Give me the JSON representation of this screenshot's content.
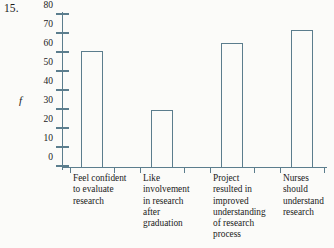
{
  "problem": {
    "number": "15."
  },
  "chart_data": {
    "type": "bar",
    "title": "",
    "subtitle": "",
    "xlabel": "",
    "ylabel": "f",
    "ylim": [
      0,
      80
    ],
    "yticks": [
      0,
      10,
      20,
      30,
      40,
      50,
      60,
      70,
      80
    ],
    "ytick_labels": [
      "0",
      "10",
      "20",
      "30",
      "40",
      "50",
      "60",
      "70",
      "80"
    ],
    "grid": false,
    "legend": null,
    "legend_position": "none",
    "bar_style": "outlined",
    "colors": {
      "bar_outline": "#5b7d8d",
      "bar_fill": "none",
      "axis": "#5b7d8d",
      "text": "#1a1a1a",
      "background": "#fbfbf9"
    },
    "categories": [
      "Feel confident to evaluate research",
      "Like involvement in research after graduation",
      "Project resulted in improved understanding of research process",
      "Nurses should understand research"
    ],
    "category_label_lines": [
      [
        "Feel confident",
        "to evaluate",
        "research"
      ],
      [
        "Like",
        "involvement",
        "in research",
        "after",
        "graduation"
      ],
      [
        "Project",
        "resulted in",
        "improved",
        "understanding",
        "of research",
        "process"
      ],
      [
        "Nurses",
        "should",
        "understand",
        "research"
      ]
    ],
    "values": [
      61,
      30,
      65,
      72
    ]
  }
}
